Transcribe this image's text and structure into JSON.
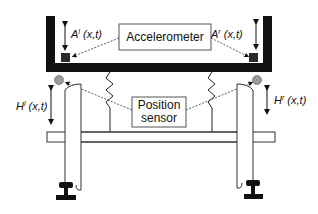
{
  "diagram": {
    "labels": {
      "accelerometer": "Accelerometer",
      "position_line1": "Position",
      "position_line2": "sensor",
      "A_left": "A",
      "A_left_sup": "l",
      "A_left_args": " (x,t)",
      "A_right": "A",
      "A_right_sup": "r",
      "A_right_args": " (x,t)",
      "H_left": "H",
      "H_left_sup": "l",
      "H_left_args": " (x,t)",
      "H_right": "H",
      "H_right_sup": "r",
      "H_right_args": " (x,t)"
    },
    "colors": {
      "frame": "#111111",
      "sensor_dot": "#9a9a9a",
      "accelerometer_block": "#2a2a2a",
      "stroke": "#222222"
    }
  }
}
